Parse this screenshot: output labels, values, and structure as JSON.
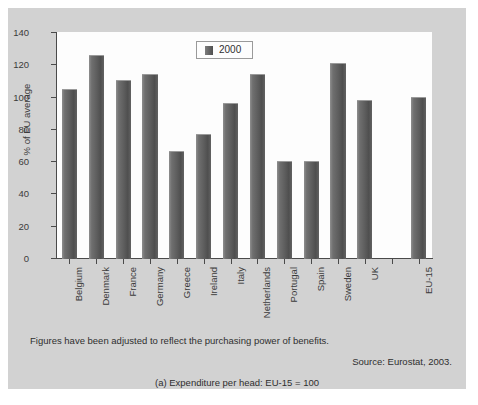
{
  "chart_data": {
    "type": "bar",
    "title": "",
    "xlabel": "",
    "ylabel": "% of EU average",
    "ylim": [
      0,
      140
    ],
    "yticks": [
      0,
      20,
      40,
      60,
      80,
      100,
      120,
      140
    ],
    "grid": false,
    "legend": {
      "position": "top-center",
      "entries": [
        {
          "name": "2000",
          "color": "#5c5c5c"
        }
      ]
    },
    "categories": [
      "Belgium",
      "Denmark",
      "France",
      "Germany",
      "Greece",
      "Ireland",
      "Italy",
      "Netherlands",
      "Portugal",
      "Spain",
      "Sweden",
      "UK",
      "",
      "EU-15"
    ],
    "series": [
      {
        "name": "2000",
        "values": [
          105,
          126,
          110,
          114,
          66,
          77,
          96,
          114,
          60,
          60,
          121,
          98,
          null,
          100
        ]
      }
    ]
  },
  "legend": {
    "label": "2000"
  },
  "axis": {
    "y_title": "% of EU average"
  },
  "notes": {
    "adjusted": "Figures have been adjusted to reflect the purchasing power of benefits.",
    "source": "Source: Eurostat, 2003.",
    "caption": "(a) Expenditure per head: EU-15 = 100"
  },
  "colors": {
    "panel_background": "#d2d2d2",
    "plot_background": "#fdfdfd",
    "bar": "#5c5c5c",
    "axis": "#4a4a4a",
    "text": "#2f2f2f"
  }
}
